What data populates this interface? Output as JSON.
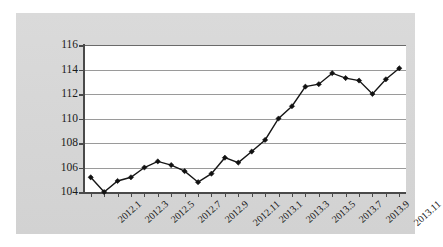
{
  "chart_data": {
    "type": "line",
    "title": "",
    "subtitle": "",
    "xlabel": "",
    "ylabel": "",
    "ylim": [
      104,
      116
    ],
    "ytick_labels": [
      "104",
      "106",
      "108",
      "110",
      "112",
      "114",
      "116"
    ],
    "ytick_values": [
      104,
      106,
      108,
      110,
      112,
      114,
      116
    ],
    "grid": true,
    "legend": false,
    "legend_position": "none",
    "marker": "diamond",
    "line_color": "#161616",
    "marker_color": "#111111",
    "plot_background": "#ffffff",
    "canvas_background": "#d6d6d6",
    "gridline_color": "#9a9a9a",
    "axis_color": "#4a4a4a",
    "x": [
      "2012.1",
      "2012.2",
      "2012.3",
      "2012.4",
      "2012.5",
      "2012.6",
      "2012.7",
      "2012.8",
      "2012.9",
      "2012.10",
      "2012.11",
      "2012.12",
      "2013.1",
      "2013.2",
      "2013.3",
      "2013.4",
      "2013.5",
      "2013.6",
      "2013.7",
      "2013.8",
      "2013.9",
      "2013.10",
      "2013.11",
      "2013.12"
    ],
    "xtick_labels": [
      "2012.1",
      "2012.3",
      "2012.5",
      "2012.7",
      "2012.9",
      "2012.11",
      "2013.1",
      "2013.3",
      "2013.5",
      "2013.7",
      "2013.9",
      "2013.11"
    ],
    "xtick_indices": [
      0,
      2,
      4,
      6,
      8,
      10,
      12,
      14,
      16,
      18,
      20,
      22
    ],
    "values": [
      105.2,
      104.0,
      104.9,
      105.2,
      106.0,
      106.5,
      106.2,
      105.7,
      104.8,
      105.5,
      106.8,
      106.4,
      107.3,
      108.25,
      110.0,
      111.0,
      112.6,
      112.8,
      113.7,
      113.3,
      113.1,
      112.0,
      113.2,
      114.1
    ]
  }
}
